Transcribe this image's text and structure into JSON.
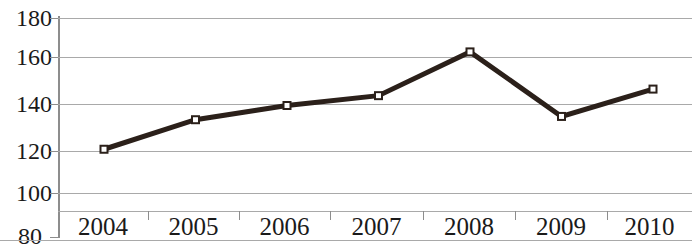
{
  "chart_data": {
    "type": "line",
    "title": "",
    "subtitle": "",
    "xlabel": "",
    "ylabel": "",
    "categories": [
      "2004",
      "2005",
      "2006",
      "2007",
      "2008",
      "2009",
      "2010"
    ],
    "series": [
      {
        "name": "",
        "values": [
          120,
          133.5,
          140,
          144.5,
          164.5,
          135,
          147.5
        ]
      }
    ],
    "ylim": [
      80,
      180
    ],
    "yticks": [
      180,
      160,
      140,
      120,
      100,
      80
    ],
    "ytick_labels": [
      "180",
      "160",
      "140",
      "120",
      "100",
      "80"
    ],
    "grid": true,
    "grid_axis": "y",
    "legend": false,
    "legend_position": "none",
    "marker": "square",
    "marker_fill": "#ffffff",
    "line_color": "#2b201a",
    "grid_color": "#a9a9a9",
    "axis_color": "#8d8d8d",
    "text_color": "#1a1a1a",
    "background": "#ffffff"
  },
  "axis": {
    "y_labels": [
      "180",
      "160",
      "140",
      "120",
      "100",
      "80"
    ],
    "x_labels": [
      "2004",
      "2005",
      "2006",
      "2007",
      "2008",
      "2009",
      "2010"
    ]
  }
}
